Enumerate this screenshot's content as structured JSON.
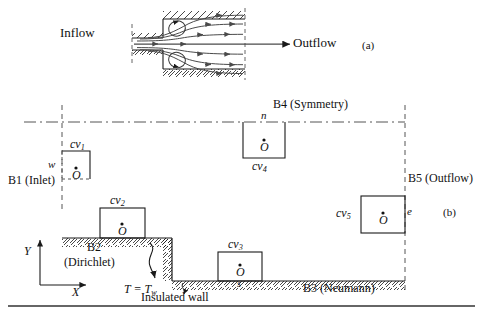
{
  "figure": {
    "panel_a_marker": "(a)",
    "panel_b_marker": "(b)"
  },
  "panel_a": {
    "inflow_label": "Inflow",
    "outflow_label": "Outflow",
    "description": "sudden-expansion duct with recirculation vortices and streamlines"
  },
  "panel_b": {
    "boundaries": {
      "b1": "B1 (Inlet)",
      "b2_line1": "B2",
      "b2_line2": "(Dirichlet)",
      "b3": "B3 (Neumann)",
      "b4": "B4 (Symmetry)",
      "b5": "B5 (Outflow)"
    },
    "annotations": {
      "wall_temperature": "T = T",
      "wall_temperature_sub": "w",
      "insulated_wall": "Insulated wall"
    },
    "axes": {
      "y_label": "Y",
      "x_label": "X"
    },
    "control_volumes": [
      {
        "id": "cv1",
        "name": "cv",
        "index": "1",
        "center": "O",
        "face": "w"
      },
      {
        "id": "cv2",
        "name": "cv",
        "index": "2",
        "center": "O",
        "face": ""
      },
      {
        "id": "cv3",
        "name": "cv",
        "index": "3",
        "center": "O",
        "face": "s"
      },
      {
        "id": "cv4",
        "name": "cv",
        "index": "4",
        "center": "O",
        "face": "n"
      },
      {
        "id": "cv5",
        "name": "cv",
        "index": "5",
        "center": "O",
        "face": "e"
      }
    ]
  },
  "colors": {
    "line": "#1a1a1a",
    "hatch": "#1a1a1a",
    "stream": "#4a4a4a",
    "dashed": "#555555",
    "rule": "#333333"
  }
}
